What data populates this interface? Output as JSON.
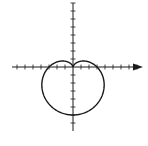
{
  "chart_data": {
    "type": "line",
    "title": "",
    "xlabel": "",
    "ylabel": "",
    "curve": "cardioid",
    "equation": "r = 3(1 - sin θ)",
    "polar": {
      "a": 3,
      "form": "r = a(1 - sin(theta))"
    },
    "x_axis": {
      "min": -8,
      "max": 9,
      "ticks": [
        -7,
        -6,
        -5,
        -4,
        -3,
        -2,
        -1,
        1,
        2,
        3,
        4,
        5,
        6,
        7,
        8
      ],
      "arrow": "right"
    },
    "y_axis": {
      "min": -8,
      "max": 8,
      "ticks": [
        -7,
        -6,
        -5,
        -4,
        -3,
        -2,
        -1,
        1,
        2,
        3,
        4,
        5,
        6,
        7,
        8
      ],
      "arrow": "none"
    },
    "key_points": [
      {
        "label": "cusp",
        "x": 0,
        "y": 0
      },
      {
        "label": "bottom",
        "x": 0,
        "y": -6
      },
      {
        "label": "x-intercept-left",
        "x": -3,
        "y": 0
      },
      {
        "label": "x-intercept-right",
        "x": 3,
        "y": 0
      }
    ],
    "grid": false,
    "legend": null,
    "colors": {
      "curve": "#1a1a1a",
      "axes": "#1a1a1a",
      "background": "#ffffff"
    }
  },
  "layout": {
    "origin_px": [
      73,
      67
    ],
    "unit_px": 8,
    "y_axis_top_px": 3,
    "y_axis_bottom_px": 131,
    "x_axis_left_px": 12,
    "x_axis_right_px": 143
  }
}
